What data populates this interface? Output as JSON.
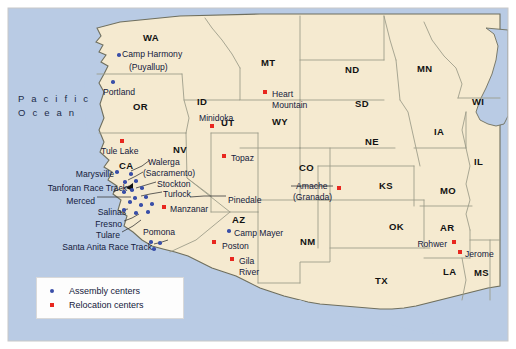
{
  "map": {
    "title": "Japanese American Assembly and Relocation Centers",
    "ocean_label_line1": "P a c i f i c",
    "ocean_label_line2": "O c e a n",
    "colors": {
      "ocean": "#b9cbe4",
      "land": "#f5ead0",
      "border": "#8a8a7a",
      "assembly_marker": "#3a4fa8",
      "relocation_marker": "#e8271f",
      "label_text": "#14203c"
    }
  },
  "legend": {
    "items": [
      {
        "symbol": "dot",
        "label": "Assembly centers"
      },
      {
        "symbol": "square",
        "label": "Relocation centers"
      }
    ]
  },
  "states": [
    {
      "abbr": "WA",
      "x": 143,
      "y": 33
    },
    {
      "abbr": "OR",
      "x": 133,
      "y": 102
    },
    {
      "abbr": "CA",
      "x": 119,
      "y": 161
    },
    {
      "abbr": "NV",
      "x": 173,
      "y": 145
    },
    {
      "abbr": "ID",
      "x": 197,
      "y": 97
    },
    {
      "abbr": "MT",
      "x": 261,
      "y": 58
    },
    {
      "abbr": "WY",
      "x": 272,
      "y": 117
    },
    {
      "abbr": "UT",
      "x": 221,
      "y": 118
    },
    {
      "abbr": "AZ",
      "x": 232,
      "y": 215
    },
    {
      "abbr": "NM",
      "x": 300,
      "y": 237
    },
    {
      "abbr": "CO",
      "x": 299,
      "y": 163
    },
    {
      "abbr": "ND",
      "x": 345,
      "y": 65
    },
    {
      "abbr": "SD",
      "x": 355,
      "y": 99
    },
    {
      "abbr": "NE",
      "x": 365,
      "y": 137
    },
    {
      "abbr": "KS",
      "x": 379,
      "y": 181
    },
    {
      "abbr": "OK",
      "x": 389,
      "y": 222
    },
    {
      "abbr": "TX",
      "x": 375,
      "y": 276
    },
    {
      "abbr": "MN",
      "x": 417,
      "y": 64
    },
    {
      "abbr": "IA",
      "x": 434,
      "y": 127
    },
    {
      "abbr": "MO",
      "x": 440,
      "y": 186
    },
    {
      "abbr": "AR",
      "x": 440,
      "y": 223
    },
    {
      "abbr": "LA",
      "x": 443,
      "y": 267
    },
    {
      "abbr": "WI",
      "x": 472,
      "y": 97
    },
    {
      "abbr": "IL",
      "x": 474,
      "y": 157
    },
    {
      "abbr": "MS",
      "x": 474,
      "y": 268
    }
  ],
  "places": [
    {
      "name": "Camp Harmony",
      "type": "assembly",
      "label_x": 122,
      "label_y": 50,
      "align": "left",
      "marker_x": 117,
      "marker_y": 53
    },
    {
      "name": "(Puyallup)",
      "type": "none",
      "label_x": 129,
      "label_y": 63,
      "align": "left"
    },
    {
      "name": "Portland",
      "type": "assembly",
      "label_x": 103,
      "label_y": 88,
      "align": "left",
      "marker_x": 111,
      "marker_y": 80
    },
    {
      "name": "Tule Lake",
      "type": "relocation",
      "label_x": 101,
      "label_y": 147,
      "align": "left",
      "marker_x": 120,
      "marker_y": 139
    },
    {
      "name": "Walerga",
      "type": "none",
      "label_x": 148,
      "label_y": 158,
      "align": "left"
    },
    {
      "name": "(Sacramento)",
      "type": "none",
      "label_x": 143,
      "label_y": 169,
      "align": "left"
    },
    {
      "name": "Stockton",
      "type": "none",
      "label_x": 157,
      "label_y": 180,
      "align": "left"
    },
    {
      "name": "Turlock",
      "type": "none",
      "label_x": 163,
      "label_y": 190,
      "align": "left"
    },
    {
      "name": "Marysville",
      "type": "none",
      "label_x": 114,
      "label_y": 170,
      "align": "right"
    },
    {
      "name": "Tanforan Race Track",
      "type": "none",
      "label_x": 127,
      "label_y": 184,
      "align": "right"
    },
    {
      "name": "Merced",
      "type": "none",
      "label_x": 95,
      "label_y": 197,
      "align": "right"
    },
    {
      "name": "Salinas",
      "type": "none",
      "label_x": 126,
      "label_y": 208,
      "align": "right"
    },
    {
      "name": "Fresno",
      "type": "none",
      "label_x": 122,
      "label_y": 220,
      "align": "right"
    },
    {
      "name": "Tulare",
      "type": "none",
      "label_x": 120,
      "label_y": 231,
      "align": "right"
    },
    {
      "name": "Santa Anita Race Track",
      "type": "none",
      "label_x": 152,
      "label_y": 243,
      "align": "right"
    },
    {
      "name": "Pomona",
      "type": "none",
      "label_x": 143,
      "label_y": 228,
      "align": "left"
    },
    {
      "name": "Manzanar",
      "type": "relocation",
      "label_x": 170,
      "label_y": 205,
      "align": "left",
      "marker_x": 162,
      "marker_y": 205
    },
    {
      "name": "Topaz",
      "type": "relocation",
      "label_x": 231,
      "label_y": 154,
      "align": "left",
      "marker_x": 222,
      "marker_y": 154
    },
    {
      "name": "Pinedale",
      "type": "none",
      "label_x": 228,
      "label_y": 196,
      "align": "left"
    },
    {
      "name": "Minidoka",
      "type": "relocation",
      "label_x": 199,
      "label_y": 114,
      "align": "left",
      "marker_x": 210,
      "marker_y": 124
    },
    {
      "name": "Heart",
      "type": "relocation",
      "label_x": 272,
      "label_y": 90,
      "align": "left",
      "marker_x": 263,
      "marker_y": 90
    },
    {
      "name": "Mountain",
      "type": "none",
      "label_x": 272,
      "label_y": 101,
      "align": "left"
    },
    {
      "name": "Amache",
      "type": "relocation",
      "label_x": 296,
      "label_y": 182,
      "align": "left",
      "marker_x": 337,
      "marker_y": 186
    },
    {
      "name": "(Granada)",
      "type": "none",
      "label_x": 293,
      "label_y": 193,
      "align": "left"
    },
    {
      "name": "Camp Mayer",
      "type": "assembly",
      "label_x": 234,
      "label_y": 229,
      "align": "left",
      "marker_x": 227,
      "marker_y": 229
    },
    {
      "name": "Poston",
      "type": "relocation",
      "label_x": 222,
      "label_y": 242,
      "align": "left",
      "marker_x": 212,
      "marker_y": 240
    },
    {
      "name": "Gila",
      "type": "relocation",
      "label_x": 239,
      "label_y": 257,
      "align": "left",
      "marker_x": 230,
      "marker_y": 257
    },
    {
      "name": "River",
      "type": "none",
      "label_x": 239,
      "label_y": 268,
      "align": "left"
    },
    {
      "name": "Rohwer",
      "type": "relocation",
      "label_x": 447,
      "label_y": 240,
      "align": "right",
      "marker_x": 452,
      "marker_y": 240
    },
    {
      "name": "Jerome",
      "type": "relocation",
      "label_x": 465,
      "label_y": 250,
      "align": "left",
      "marker_x": 458,
      "marker_y": 250
    }
  ],
  "assembly_dots": [
    {
      "x": 115,
      "y": 170
    },
    {
      "x": 129,
      "y": 172
    },
    {
      "x": 123,
      "y": 180
    },
    {
      "x": 134,
      "y": 179
    },
    {
      "x": 130,
      "y": 188
    },
    {
      "x": 140,
      "y": 186
    },
    {
      "x": 122,
      "y": 190
    },
    {
      "x": 133,
      "y": 196
    },
    {
      "x": 144,
      "y": 195
    },
    {
      "x": 128,
      "y": 200
    },
    {
      "x": 139,
      "y": 203
    },
    {
      "x": 150,
      "y": 202
    },
    {
      "x": 122,
      "y": 208
    },
    {
      "x": 134,
      "y": 211
    },
    {
      "x": 146,
      "y": 210
    },
    {
      "x": 111,
      "y": 80
    },
    {
      "x": 117,
      "y": 53
    },
    {
      "x": 149,
      "y": 240
    },
    {
      "x": 158,
      "y": 241
    },
    {
      "x": 152,
      "y": 247
    },
    {
      "x": 227,
      "y": 229
    }
  ]
}
